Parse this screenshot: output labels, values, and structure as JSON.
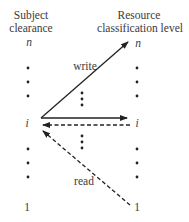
{
  "diagram": {
    "left_column": {
      "header_line1": "Subject",
      "header_line2": "clearance",
      "top_level": "n",
      "middle_level": "i",
      "bottom_level": "1"
    },
    "right_column": {
      "header_line1": "Resource",
      "header_line2": "classification level",
      "top_level": "n",
      "middle_level": "i",
      "bottom_level": "1"
    },
    "arrows": [
      {
        "label": "write",
        "from": "subject i",
        "to": "resource n",
        "style": "solid"
      },
      {
        "label": "",
        "from": "subject i",
        "to": "resource i",
        "style": "solid"
      },
      {
        "label": "",
        "from": "resource i",
        "to": "subject i",
        "style": "dashed"
      },
      {
        "label": "read",
        "from": "resource 1",
        "to": "subject i",
        "style": "dashed"
      }
    ],
    "labels": {
      "write": "write",
      "read": "read"
    }
  }
}
